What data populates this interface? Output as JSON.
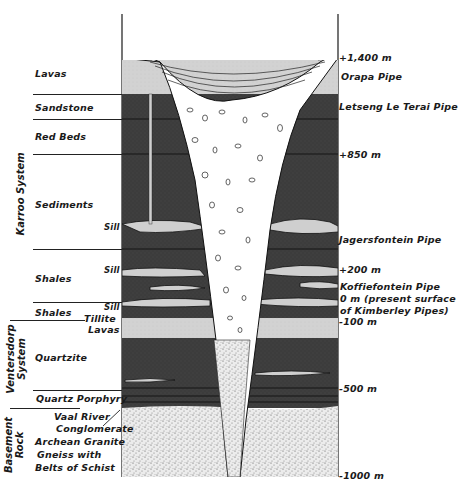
{
  "diagram": {
    "left_groups": [
      {
        "label": "Karroo System",
        "units": [
          "Lavas",
          "Sandstone",
          "Red Beds",
          "Sediments",
          "Shales",
          "Shales"
        ]
      },
      {
        "label": "Ventersdorp System",
        "units": [
          "Tillite Lavas",
          "Quartzite",
          "Quartz Porphyry"
        ]
      },
      {
        "label": "Basement Rock",
        "units": [
          "Vaal River Conglomerate",
          "Archean Granite Gneiss with Belts of Schist"
        ]
      }
    ],
    "left_labels": {
      "lavas": "Lavas",
      "sandstone": "Sandstone",
      "red_beds": "Red Beds",
      "sediments": "Sediments",
      "sill_1": "Sill",
      "shales_1": "Shales",
      "sill_2": "Sill",
      "shales_2": "Shales",
      "sill_3": "Sill",
      "tillite_1": "Tillite",
      "tillite_2": "Lavas",
      "quartzite": "Quartzite",
      "quartz_porphyry": "Quartz Porphyry",
      "vaal_1": "Vaal River",
      "vaal_2": "Conglomerate",
      "archean_1": "Archean Granite",
      "archean_2": "Gneiss with",
      "archean_3": "Belts of Schist"
    },
    "group_labels": {
      "karroo": "Karroo System",
      "ventersdorp_1": "Ventersdorp",
      "ventersdorp_2": "System",
      "basement_1": "Basement",
      "basement_2": "Rock"
    },
    "right_labels": {
      "elev_1400": "+1,400 m",
      "orapa": "Orapa Pipe",
      "letseng": "Letseng Le Terai Pipe",
      "elev_850": "+850 m",
      "jagersfontein": "Jagersfontein Pipe",
      "elev_200": "+200 m",
      "koffiefontein": "Koffiefontein Pipe",
      "zero_1": "0 m (present surface",
      "zero_2": "of Kimberley Pipes)",
      "elev_m100": "-100 m",
      "elev_m500": "-500 m",
      "elev_m1000": "-1000 m"
    },
    "colors": {
      "dark_rock": "#3a3a3a",
      "light_layer": "#c8c8c8",
      "lavas": "#d4d4d4",
      "basement": "#e6e6e6",
      "pipe": "#ffffff",
      "line": "#1a1a1a"
    }
  }
}
